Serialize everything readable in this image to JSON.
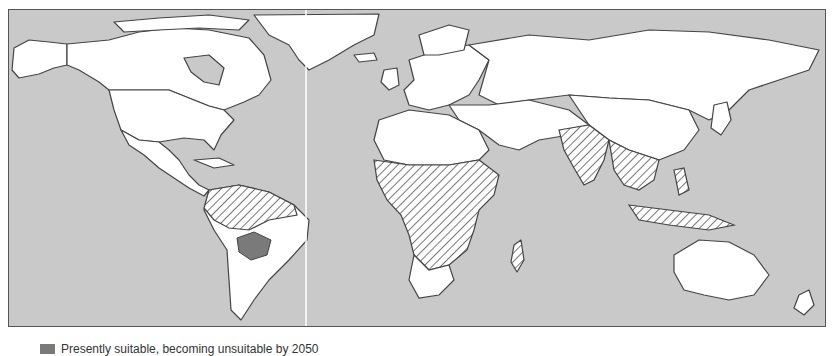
{
  "figure": {
    "type": "world-map",
    "projection": "equirectangular",
    "colors": {
      "ocean": "#c9c9c9",
      "land": "#ffffff",
      "border": "#444444",
      "hatch": "#555555",
      "legend_swatch": "#7a7a7a",
      "meridian_line": "#ffffff"
    },
    "regions": [
      {
        "name": "Africa (sub-Saharan)",
        "pattern": "hatched"
      },
      {
        "name": "South America (Amazon basin)",
        "pattern": "hatched"
      },
      {
        "name": "South Asia",
        "pattern": "hatched"
      },
      {
        "name": "Southeast Asia",
        "pattern": "hatched"
      },
      {
        "name": "Paraguay / south-central Brazil",
        "pattern": "solid-gray"
      }
    ]
  },
  "legend": {
    "items": [
      {
        "swatch": "solid-gray",
        "label": "Presently suitable, becoming unsuitable by 2050"
      }
    ]
  }
}
